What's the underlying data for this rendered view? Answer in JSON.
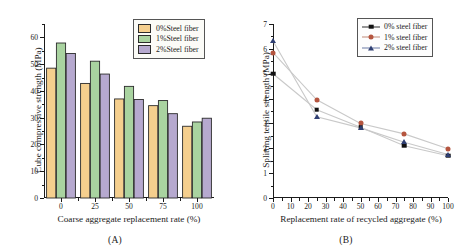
{
  "figure": {
    "panels": [
      {
        "caption": "(A)"
      },
      {
        "caption": "(B)"
      }
    ]
  },
  "panel_a": {
    "caption": "(A)",
    "legend": {
      "items": [
        {
          "label": "0%Steel fiber",
          "color": "#f5cf8e",
          "swatch_name": "legend-swatch-0pct"
        },
        {
          "label": "1%Steel fiber",
          "color": "#a9d3a0",
          "swatch_name": "legend-swatch-1pct"
        },
        {
          "label": "2%Steel fiber",
          "color": "#b6a9cf",
          "swatch_name": "legend-swatch-2pct"
        }
      ]
    },
    "chart_data": {
      "type": "bar",
      "title": "",
      "xlabel": "Coarse aggregate replacement rate (%)",
      "ylabel": "Cube compressive strength (MPa)",
      "categories": [
        "0",
        "25",
        "50",
        "75",
        "100"
      ],
      "xtick_labels": [
        "0",
        "25",
        "50",
        "75",
        "100"
      ],
      "ytick_labels": [
        "0",
        "10",
        "20",
        "30",
        "40",
        "50",
        "60"
      ],
      "ylim": [
        0,
        65
      ],
      "yticks": [
        0,
        10,
        20,
        30,
        40,
        50,
        60
      ],
      "grid": false,
      "legend_position": "top-right",
      "series": [
        {
          "name": "0%Steel fiber",
          "color": "#f5cf8e",
          "values": [
            48.5,
            42.8,
            37.0,
            34.5,
            26.8
          ]
        },
        {
          "name": "1%Steel fiber",
          "color": "#a9d3a0",
          "values": [
            57.9,
            51.1,
            41.7,
            36.4,
            28.4
          ]
        },
        {
          "name": "2%Steel fiber",
          "color": "#b6a9cf",
          "values": [
            54.0,
            46.3,
            36.8,
            31.5,
            29.8
          ]
        }
      ]
    }
  },
  "panel_b": {
    "caption": "(B)",
    "legend": {
      "items": [
        {
          "label": "0% steel fiber",
          "color": "#111111",
          "marker": "square",
          "marker_name": "legend-marker-square"
        },
        {
          "label": "1% steel fiber",
          "color": "#b5553f",
          "marker": "circle",
          "marker_name": "legend-marker-circle"
        },
        {
          "label": "2% steel fiber",
          "color": "#2f3f72",
          "marker": "triangle",
          "marker_name": "legend-marker-triangle"
        }
      ]
    },
    "chart_data": {
      "type": "line",
      "title": "",
      "xlabel": "Replacement rate of recycled aggregate (%)",
      "ylabel": "Splitting tensile strength (MPa)",
      "x": [
        0,
        25,
        50,
        75,
        100
      ],
      "xtick_labels": [
        "0",
        "10",
        "20",
        "30",
        "40",
        "50",
        "60",
        "70",
        "80",
        "90",
        "100"
      ],
      "xticks": [
        0,
        10,
        20,
        30,
        40,
        50,
        60,
        70,
        80,
        90,
        100
      ],
      "ytick_labels": [
        "0",
        "1",
        "2",
        "3",
        "4",
        "5",
        "6",
        "7"
      ],
      "yticks": [
        0,
        1,
        2,
        3,
        4,
        5,
        6,
        7
      ],
      "xlim": [
        0,
        100
      ],
      "ylim": [
        0,
        7
      ],
      "grid": false,
      "legend_position": "top-right",
      "series": [
        {
          "name": "0% steel fiber",
          "color": "#111111",
          "marker": "square",
          "values": [
            5.0,
            3.55,
            2.85,
            2.1,
            1.7
          ]
        },
        {
          "name": "1% steel fiber",
          "color": "#b5553f",
          "marker": "circle",
          "values": [
            5.85,
            3.95,
            3.0,
            2.58,
            1.98
          ]
        },
        {
          "name": "2% steel fiber",
          "color": "#2f3f72",
          "marker": "triangle",
          "values": [
            6.32,
            3.27,
            2.82,
            2.24,
            1.75
          ]
        }
      ]
    }
  }
}
